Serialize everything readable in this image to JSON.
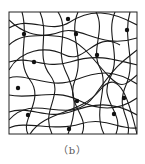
{
  "figure": {
    "caption": "（b）",
    "frame": {
      "x": 9,
      "y": 12,
      "width": 128,
      "height": 122
    },
    "stroke_color": "#1a1a1a",
    "node_color": "#111111",
    "fibers": [
      "M9,28 C30,15 50,35 70,22 S110,10 137,25",
      "M9,45 C25,30 40,40 60,32 S100,50 137,38",
      "M9,62 C30,55 45,70 70,62 S110,58 137,65",
      "M9,78 C25,72 50,90 75,80 S115,70 137,84",
      "M9,95 C30,100 55,88 78,100 S120,110 137,98",
      "M9,112 C28,105 48,120 70,112 S112,100 137,115",
      "M9,128 C25,120 55,132 80,124 S118,130 137,128",
      "M22,12 C30,40 15,60 30,80 S20,120 28,134",
      "M40,12 C50,35 35,55 50,75 S40,110 52,134",
      "M58,12 C70,30 55,50 65,70 S78,110 68,134",
      "M78,12 C68,35 85,55 75,80 S90,115 82,134",
      "M96,12 C106,30 90,50 100,68 S92,110 104,134",
      "M115,12 C105,35 122,55 110,78 S125,112 116,134",
      "M130,12 C122,40 137,60 126,85 S132,118 128,134",
      "M9,20 C40,50 60,20 90,55 S120,90 137,75",
      "M9,120 C35,90 70,130 95,95 S125,60 137,50",
      "M30,134 C45,110 80,115 100,90 S130,105 137,134",
      "M9,70 C20,50 45,45 65,55 S95,30 120,45"
    ],
    "nodes": [
      {
        "x": 24,
        "y": 34
      },
      {
        "x": 68,
        "y": 19
      },
      {
        "x": 76,
        "y": 34
      },
      {
        "x": 127,
        "y": 30
      },
      {
        "x": 34,
        "y": 62
      },
      {
        "x": 97,
        "y": 55
      },
      {
        "x": 18,
        "y": 88
      },
      {
        "x": 77,
        "y": 101
      },
      {
        "x": 124,
        "y": 98
      },
      {
        "x": 28,
        "y": 115
      },
      {
        "x": 114,
        "y": 114
      },
      {
        "x": 69,
        "y": 129
      }
    ]
  }
}
